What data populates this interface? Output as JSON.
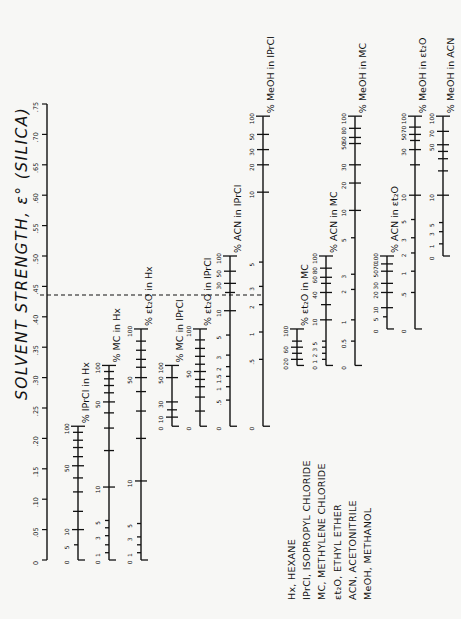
{
  "chart_data": {
    "type": "nomogram",
    "title": "SOLVENT STRENGTH, ε° (SILICA)",
    "orientation": "rotated 90° counter-clockwise",
    "main_axis": {
      "label": "SOLVENT STRENGTH, ε° (SILICA)",
      "ticks": [
        "0",
        ".05",
        ".10",
        ".15",
        ".20",
        ".25",
        ".30",
        ".35",
        ".40",
        ".45",
        ".50",
        ".55",
        ".60",
        ".65",
        ".70",
        ".75"
      ],
      "range": [
        0,
        0.75
      ]
    },
    "reference_line": {
      "value": 0.3,
      "style": "dashed"
    },
    "scales": [
      {
        "name": "% IPrCl in Hx",
        "eps_range": [
          0.0,
          0.22
        ],
        "ticks": [
          {
            "label": "0",
            "pct": 0,
            "eps": 0.0
          },
          {
            "label": "5",
            "pct": 5,
            "eps": 0.025
          },
          {
            "label": "10",
            "pct": 10,
            "eps": 0.05
          },
          {
            "label": "",
            "pct": 20,
            "eps": 0.08
          },
          {
            "label": "",
            "pct": 30,
            "eps": 0.112
          },
          {
            "label": "",
            "pct": 40,
            "eps": 0.135
          },
          {
            "label": "50",
            "pct": 50,
            "eps": 0.155
          },
          {
            "label": "",
            "pct": 60,
            "eps": 0.17
          },
          {
            "label": "",
            "pct": 70,
            "eps": 0.185
          },
          {
            "label": "",
            "pct": 80,
            "eps": 0.197
          },
          {
            "label": "",
            "pct": 90,
            "eps": 0.21
          },
          {
            "label": "100",
            "pct": 100,
            "eps": 0.22
          }
        ]
      },
      {
        "name": "% MC in Hx",
        "eps_range": [
          0.0,
          0.32
        ],
        "ticks": [
          {
            "label": "0",
            "pct": 0,
            "eps": 0.0
          },
          {
            "label": "1",
            "pct": 1,
            "eps": 0.012
          },
          {
            "label": "",
            "pct": 2,
            "eps": 0.025
          },
          {
            "label": "3",
            "pct": 3,
            "eps": 0.04
          },
          {
            "label": "",
            "pct": 4,
            "eps": 0.053
          },
          {
            "label": "5",
            "pct": 5,
            "eps": 0.065
          },
          {
            "label": "10",
            "pct": 10,
            "eps": 0.12
          },
          {
            "label": "",
            "pct": 20,
            "eps": 0.18
          },
          {
            "label": "",
            "pct": 30,
            "eps": 0.217
          },
          {
            "label": "",
            "pct": 40,
            "eps": 0.242
          },
          {
            "label": "50",
            "pct": 50,
            "eps": 0.26
          },
          {
            "label": "",
            "pct": 60,
            "eps": 0.275
          },
          {
            "label": "",
            "pct": 70,
            "eps": 0.287
          },
          {
            "label": "",
            "pct": 80,
            "eps": 0.298
          },
          {
            "label": "",
            "pct": 90,
            "eps": 0.31
          },
          {
            "label": "100",
            "pct": 100,
            "eps": 0.32
          }
        ]
      },
      {
        "name": "% Et2O in Hx",
        "eps_range": [
          0.0,
          0.38
        ],
        "ticks": [
          {
            "label": "0",
            "pct": 0,
            "eps": 0.0
          },
          {
            "label": "1",
            "pct": 1,
            "eps": 0.012
          },
          {
            "label": "",
            "pct": 2,
            "eps": 0.025
          },
          {
            "label": "3",
            "pct": 3,
            "eps": 0.038
          },
          {
            "label": "5",
            "pct": 5,
            "eps": 0.06
          },
          {
            "label": "10",
            "pct": 10,
            "eps": 0.13
          },
          {
            "label": "",
            "pct": 20,
            "eps": 0.2
          },
          {
            "label": "",
            "pct": 30,
            "eps": 0.245
          },
          {
            "label": "",
            "pct": 40,
            "eps": 0.277
          },
          {
            "label": "50",
            "pct": 50,
            "eps": 0.3
          },
          {
            "label": "",
            "pct": 60,
            "eps": 0.317
          },
          {
            "label": "",
            "pct": 70,
            "eps": 0.33
          },
          {
            "label": "",
            "pct": 80,
            "eps": 0.345
          },
          {
            "label": "",
            "pct": 90,
            "eps": 0.36
          },
          {
            "label": "100",
            "pct": 100,
            "eps": 0.38
          }
        ]
      },
      {
        "name": "% MC in IPrCl",
        "eps_range": [
          0.22,
          0.32
        ],
        "ticks": [
          {
            "label": "0",
            "pct": 0,
            "eps": 0.22
          },
          {
            "label": "10",
            "pct": 10,
            "eps": 0.235
          },
          {
            "label": "",
            "pct": 20,
            "eps": 0.247
          },
          {
            "label": "30",
            "pct": 30,
            "eps": 0.26
          },
          {
            "label": "50",
            "pct": 50,
            "eps": 0.3
          },
          {
            "label": "100",
            "pct": 100,
            "eps": 0.32
          }
        ]
      },
      {
        "name": "% Et2O in IPrCl",
        "eps_range": [
          0.22,
          0.38
        ],
        "ticks": [
          {
            "label": "0",
            "pct": 0,
            "eps": 0.22
          },
          {
            "label": "",
            "pct": 10,
            "eps": 0.245
          },
          {
            "label": "",
            "pct": 20,
            "eps": 0.268
          },
          {
            "label": "",
            "pct": 30,
            "eps": 0.285
          },
          {
            "label": "",
            "pct": 40,
            "eps": 0.297
          },
          {
            "label": "50",
            "pct": 50,
            "eps": 0.31
          },
          {
            "label": "",
            "pct": 60,
            "eps": 0.322
          },
          {
            "label": "",
            "pct": 70,
            "eps": 0.335
          },
          {
            "label": "",
            "pct": 80,
            "eps": 0.348
          },
          {
            "label": "",
            "pct": 90,
            "eps": 0.362
          },
          {
            "label": "100",
            "pct": 100,
            "eps": 0.38
          }
        ]
      },
      {
        "name": "% ACN in IPrCl",
        "eps_range": [
          0.22,
          0.5
        ],
        "ticks": [
          {
            "label": "0",
            "pct": 0,
            "eps": 0.22
          },
          {
            "label": ".5",
            "pct": 0.5,
            "eps": 0.263
          },
          {
            "label": "1",
            "pct": 1,
            "eps": 0.285
          },
          {
            "label": "1.5",
            "pct": 1.5,
            "eps": 0.302
          },
          {
            "label": "2",
            "pct": 2,
            "eps": 0.318
          },
          {
            "label": "3",
            "pct": 3,
            "eps": 0.337
          },
          {
            "label": "5",
            "pct": 5,
            "eps": 0.37
          },
          {
            "label": "10",
            "pct": 10,
            "eps": 0.41
          },
          {
            "label": "",
            "pct": 20,
            "eps": 0.44
          },
          {
            "label": "30",
            "pct": 30,
            "eps": 0.455
          },
          {
            "label": "50",
            "pct": 50,
            "eps": 0.475
          },
          {
            "label": "100",
            "pct": 100,
            "eps": 0.5
          }
        ]
      },
      {
        "name": "% MeOH in IPrCl",
        "eps_range": [
          0.22,
          0.73
        ],
        "ticks": [
          {
            "label": "0",
            "pct": 0,
            "eps": 0.22
          },
          {
            "label": ".5",
            "pct": 0.5,
            "eps": 0.33
          },
          {
            "label": "1",
            "pct": 1,
            "eps": 0.375
          },
          {
            "label": "2",
            "pct": 2,
            "eps": 0.42
          },
          {
            "label": "3",
            "pct": 3,
            "eps": 0.45
          },
          {
            "label": "5",
            "pct": 5,
            "eps": 0.49
          },
          {
            "label": "10",
            "pct": 10,
            "eps": 0.605
          },
          {
            "label": "20",
            "pct": 20,
            "eps": 0.65
          },
          {
            "label": "30",
            "pct": 30,
            "eps": 0.675
          },
          {
            "label": "50",
            "pct": 50,
            "eps": 0.7
          },
          {
            "label": "100",
            "pct": 100,
            "eps": 0.73
          }
        ]
      },
      {
        "name": "% Et2O in MC",
        "eps_range": [
          0.32,
          0.38
        ],
        "ticks": [
          {
            "label": "0",
            "pct": 0,
            "eps": 0.32
          },
          {
            "label": "20",
            "pct": 20,
            "eps": 0.33
          },
          {
            "label": "",
            "pct": 40,
            "eps": 0.34
          },
          {
            "label": "60",
            "pct": 60,
            "eps": 0.35
          },
          {
            "label": "",
            "pct": 80,
            "eps": 0.36
          },
          {
            "label": "100",
            "pct": 100,
            "eps": 0.38
          }
        ]
      },
      {
        "name": "% ACN in MC",
        "eps_range": [
          0.32,
          0.5
        ],
        "ticks": [
          {
            "label": "0",
            "pct": 0,
            "eps": 0.32
          },
          {
            "label": "1",
            "pct": 1,
            "eps": 0.33
          },
          {
            "label": "2",
            "pct": 2,
            "eps": 0.34
          },
          {
            "label": "3",
            "pct": 3,
            "eps": 0.35
          },
          {
            "label": "5",
            "pct": 5,
            "eps": 0.36
          },
          {
            "label": "10",
            "pct": 10,
            "eps": 0.395
          },
          {
            "label": "",
            "pct": 20,
            "eps": 0.42
          },
          {
            "label": "40",
            "pct": 40,
            "eps": 0.44
          },
          {
            "label": "",
            "pct": 50,
            "eps": 0.455
          },
          {
            "label": "60",
            "pct": 60,
            "eps": 0.465
          },
          {
            "label": "80",
            "pct": 80,
            "eps": 0.48
          },
          {
            "label": "100",
            "pct": 100,
            "eps": 0.5
          }
        ]
      },
      {
        "name": "% MeOH in MC",
        "eps_range": [
          0.32,
          0.73
        ],
        "ticks": [
          {
            "label": "0",
            "pct": 0,
            "eps": 0.32
          },
          {
            "label": "0.5",
            "pct": 0.5,
            "eps": 0.36
          },
          {
            "label": "1",
            "pct": 1,
            "eps": 0.395
          },
          {
            "label": "2",
            "pct": 2,
            "eps": 0.445
          },
          {
            "label": "3",
            "pct": 3,
            "eps": 0.47
          },
          {
            "label": "5",
            "pct": 5,
            "eps": 0.53
          },
          {
            "label": "10",
            "pct": 10,
            "eps": 0.575
          },
          {
            "label": "20",
            "pct": 20,
            "eps": 0.62
          },
          {
            "label": "30",
            "pct": 30,
            "eps": 0.65
          },
          {
            "label": "50",
            "pct": 50,
            "eps": 0.685
          },
          {
            "label": "60",
            "pct": 60,
            "eps": 0.695
          },
          {
            "label": "80",
            "pct": 80,
            "eps": 0.71
          },
          {
            "label": "100",
            "pct": 100,
            "eps": 0.73
          }
        ]
      },
      {
        "name": "% ACN in Et2O",
        "eps_range": [
          0.38,
          0.5
        ],
        "ticks": [
          {
            "label": "0",
            "pct": 0,
            "eps": 0.38
          },
          {
            "label": "5",
            "pct": 5,
            "eps": 0.4
          },
          {
            "label": "10",
            "pct": 10,
            "eps": 0.415
          },
          {
            "label": "20",
            "pct": 20,
            "eps": 0.44
          },
          {
            "label": "30",
            "pct": 30,
            "eps": 0.455
          },
          {
            "label": "50",
            "pct": 50,
            "eps": 0.475
          },
          {
            "label": "70",
            "pct": 70,
            "eps": 0.487
          },
          {
            "label": "100",
            "pct": 100,
            "eps": 0.5
          }
        ]
      },
      {
        "name": "% MeOH in Et2O",
        "eps_range": [
          0.38,
          0.73
        ],
        "ticks": [
          {
            "label": "0",
            "pct": 0,
            "eps": 0.38
          },
          {
            "label": ".5",
            "pct": 0.5,
            "eps": 0.44
          },
          {
            "label": "1",
            "pct": 1,
            "eps": 0.475
          },
          {
            "label": "2",
            "pct": 2,
            "eps": 0.505
          },
          {
            "label": "3",
            "pct": 3,
            "eps": 0.53
          },
          {
            "label": "5",
            "pct": 5,
            "eps": 0.56
          },
          {
            "label": "10",
            "pct": 10,
            "eps": 0.6
          },
          {
            "label": "",
            "pct": 20,
            "eps": 0.65
          },
          {
            "label": "30",
            "pct": 30,
            "eps": 0.675
          },
          {
            "label": "",
            "pct": 40,
            "eps": 0.69
          },
          {
            "label": "50",
            "pct": 50,
            "eps": 0.7
          },
          {
            "label": "70",
            "pct": 70,
            "eps": 0.712
          },
          {
            "label": "100",
            "pct": 100,
            "eps": 0.73
          }
        ]
      },
      {
        "name": "% MeOH in ACN",
        "eps_range": [
          0.5,
          0.73
        ],
        "ticks": [
          {
            "label": "0",
            "pct": 0,
            "eps": 0.5
          },
          {
            "label": "1",
            "pct": 1,
            "eps": 0.52
          },
          {
            "label": "3",
            "pct": 3,
            "eps": 0.54
          },
          {
            "label": "5",
            "pct": 5,
            "eps": 0.555
          },
          {
            "label": "10",
            "pct": 10,
            "eps": 0.6
          },
          {
            "label": "",
            "pct": 20,
            "eps": 0.64
          },
          {
            "label": "",
            "pct": 30,
            "eps": 0.66
          },
          {
            "label": "",
            "pct": 40,
            "eps": 0.672
          },
          {
            "label": "50",
            "pct": 50,
            "eps": 0.683
          },
          {
            "label": "70",
            "pct": 70,
            "eps": 0.705
          },
          {
            "label": "100",
            "pct": 100,
            "eps": 0.73
          }
        ]
      }
    ],
    "legend_position": "bottom-right (rotated)"
  },
  "legend": [
    "Hx, HEXANE",
    "IPrCl, ISOPROPYL CHLORIDE",
    "MC, METHYLENE CHLORIDE",
    "εt₂O, ETHYL ETHER",
    "ACN, ACETONITRILE",
    "MeOH, METHANOL"
  ],
  "labels": {
    "title": "SOLVENT STRENGTH, ε° (SILICA)",
    "ipcl_hx": "% IPrCl in Hx",
    "mc_hx": "% MC in Hx",
    "et2o_hx": "% εt₂O in Hx",
    "mc_iprcl": "% MC in IPrCl",
    "et2o_iprcl": "% εt₂O in IPrCl",
    "acn_iprcl": "% ACN in IPrCl",
    "meoh_iprcl": "% MeOH in IPrCl",
    "et2o_mc": "% εt₂O in MC",
    "acn_mc": "% ACN in MC",
    "meoh_mc": "% MeOH in MC",
    "acn_et2o": "% ACN in εt₂O",
    "meoh_et2o": "% MeOH in εt₂O",
    "meoh_acn": "% MeOH in ACN"
  }
}
